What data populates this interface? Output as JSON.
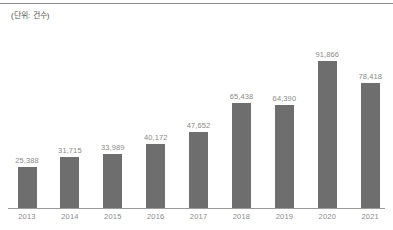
{
  "figure": {
    "unit_note": "(단위: 건수)"
  },
  "chart_data": {
    "type": "bar",
    "title": "",
    "subtitle": "",
    "xlabel": "",
    "ylabel": "",
    "unit_note": "(단위: 건수)",
    "grid": false,
    "legend": false,
    "legend_position": "none",
    "axis_baseline_visible": true,
    "yaxis_line_visible": false,
    "ylim": [
      0,
      100000
    ],
    "categories": [
      "2013",
      "2014",
      "2015",
      "2016",
      "2017",
      "2018",
      "2019",
      "2020",
      "2021"
    ],
    "values": [
      25388,
      31715,
      33989,
      40172,
      47652,
      65438,
      64390,
      91866,
      78418
    ],
    "value_labels": [
      "25,388",
      "31,715",
      "33,989",
      "40,172",
      "47,652",
      "65,438",
      "64,390",
      "91,866",
      "78,418"
    ],
    "colors": {
      "bar": "#6e6e6e",
      "value_label": "#8a8a8a",
      "tick_label": "#8a8a8a",
      "axis": "#9a9a9a",
      "top_rule": "#8c8c8c",
      "background": "#ffffff",
      "unit_note": "#555555"
    }
  }
}
